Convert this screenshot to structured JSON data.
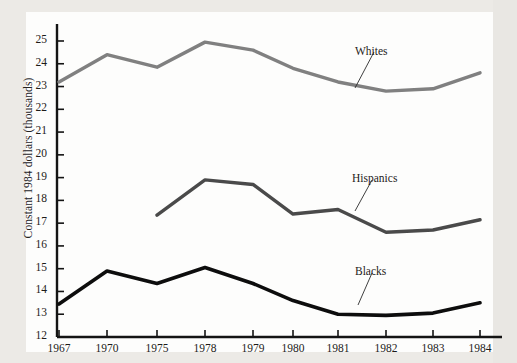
{
  "figure": {
    "background_color": "#eceae6",
    "paper_color": "#fdfdfc",
    "axis_color": "#141414"
  },
  "chart_data": {
    "type": "line",
    "title": "",
    "xlabel": "",
    "ylabel": "Constant 1984 dollars (thousands)",
    "categories": [
      "1967",
      "1970",
      "1975",
      "1978",
      "1979",
      "1980",
      "1981",
      "1982",
      "1983",
      "1984"
    ],
    "ylim": [
      12,
      25
    ],
    "yticks": [
      12,
      13,
      14,
      15,
      16,
      17,
      18,
      19,
      20,
      21,
      22,
      23,
      24,
      25
    ],
    "ytick_labels": [
      "12",
      "13",
      "14",
      "15",
      "16",
      "17",
      "18",
      "19",
      "20",
      "21",
      "22",
      "23",
      "24",
      "25"
    ],
    "grid": false,
    "legend": "inline-annotations",
    "series": [
      {
        "name": "Whites",
        "color": "#808080",
        "width": 3.4,
        "x": [
          "1967",
          "1970",
          "1975",
          "1978",
          "1979",
          "1980",
          "1981",
          "1982",
          "1983",
          "1984"
        ],
        "values": [
          23.2,
          24.4,
          23.85,
          24.95,
          24.6,
          23.8,
          23.2,
          22.8,
          22.9,
          23.6
        ]
      },
      {
        "name": "Hispanics",
        "color": "#4a4a4a",
        "width": 3.4,
        "x": [
          "1975",
          "1978",
          "1979",
          "1980",
          "1981",
          "1982",
          "1983",
          "1984"
        ],
        "values": [
          17.35,
          18.9,
          18.7,
          17.4,
          17.6,
          16.6,
          16.7,
          17.15
        ]
      },
      {
        "name": "Blacks",
        "color": "#0d0d0d",
        "width": 3.6,
        "x": [
          "1967",
          "1970",
          "1975",
          "1978",
          "1979",
          "1980",
          "1981",
          "1982",
          "1983",
          "1984"
        ],
        "values": [
          13.45,
          14.9,
          14.35,
          15.05,
          14.35,
          13.6,
          13.0,
          12.95,
          13.05,
          13.5
        ]
      }
    ],
    "annotations": [
      {
        "text": "Whites",
        "label_x": 355,
        "label_y": 45,
        "leader_from_x": 374,
        "leader_from_y": 52,
        "leader_to_x": 355,
        "leader_to_y": 88
      },
      {
        "text": "Hispanics",
        "label_x": 352,
        "label_y": 172,
        "leader_from_x": 372,
        "leader_from_y": 180,
        "leader_to_x": 355,
        "leader_to_y": 211
      },
      {
        "text": "Blacks",
        "label_x": 355,
        "label_y": 265,
        "leader_from_x": 372,
        "leader_from_y": 273,
        "leader_to_x": 358,
        "leader_to_y": 305
      }
    ]
  },
  "axis_geometry": {
    "x_positions": [
      59,
      107,
      157,
      205,
      253,
      293,
      338,
      386,
      433,
      480
    ],
    "y_top_px": 41,
    "y_bottom_px": 337,
    "y_axis_x_px": 57,
    "unit_px": 22.77
  }
}
